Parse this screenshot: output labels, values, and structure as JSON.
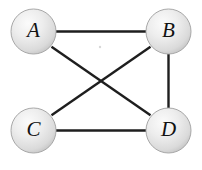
{
  "figure": {
    "background_color": "#ffffff",
    "width": 202,
    "height": 170
  },
  "style": {
    "node_fill_light": "#f2f2f2",
    "node_fill_mid": "#dcdcdc",
    "node_fill_dark": "#b9b9b9",
    "node_stroke": "#a8a8a8",
    "edge_color": "#1e1e1e",
    "label_color": "#121212",
    "node_radius": 22.5,
    "edge_width": 2.4,
    "label_font_size": 21
  },
  "graph": {
    "type": "undirected",
    "vertex_count": 4,
    "edge_count": 5,
    "nodes": [
      {
        "id": "A",
        "label": "A",
        "cx": 33.5,
        "cy": 31.5,
        "r": 22.5
      },
      {
        "id": "B",
        "label": "B",
        "cx": 168.5,
        "cy": 31.5,
        "r": 22.5
      },
      {
        "id": "C",
        "label": "C",
        "cx": 33.5,
        "cy": 130.5,
        "r": 22.5
      },
      {
        "id": "D",
        "label": "D",
        "cx": 168.5,
        "cy": 130.5,
        "r": 22.5
      }
    ],
    "edges": [
      {
        "id": "A-B",
        "from": "A",
        "to": "B",
        "x1": 56,
        "y1": 31.5,
        "x2": 146,
        "y2": 31.5
      },
      {
        "id": "B-D",
        "from": "B",
        "to": "D",
        "x1": 168.5,
        "y1": 54,
        "x2": 168.5,
        "y2": 108
      },
      {
        "id": "C-D",
        "from": "C",
        "to": "D",
        "x1": 56,
        "y1": 130.5,
        "x2": 146,
        "y2": 130.5
      },
      {
        "id": "A-D",
        "from": "A",
        "to": "D",
        "x1": 51.5,
        "y1": 46.8,
        "x2": 150.5,
        "y2": 115.2
      },
      {
        "id": "B-C",
        "from": "B",
        "to": "C",
        "x1": 150.5,
        "y1": 46.8,
        "x2": 51.5,
        "y2": 115.2
      }
    ],
    "missing_edges": [
      {
        "id": "A-C",
        "from": "A",
        "to": "C"
      }
    ]
  },
  "artifacts": {
    "speck": {
      "cx": 100,
      "cy": 47,
      "r": 1.2
    }
  }
}
